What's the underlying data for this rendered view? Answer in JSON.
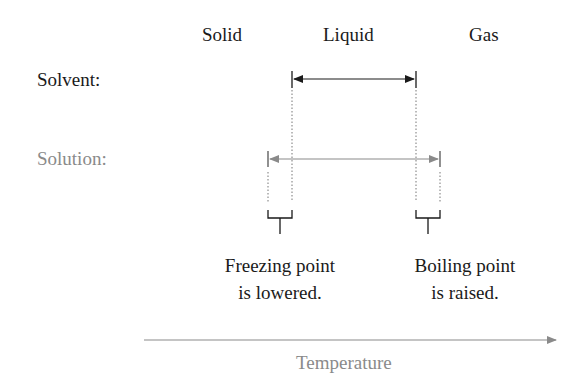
{
  "phases": {
    "solid": "Solid",
    "liquid": "Liquid",
    "gas": "Gas"
  },
  "rows": {
    "solvent_label": "Solvent:",
    "solution_label": "Solution:"
  },
  "annotations": {
    "freezing_line1": "Freezing point",
    "freezing_line2": "is lowered.",
    "boiling_line1": "Boiling point",
    "boiling_line2": "is raised."
  },
  "axis": {
    "label": "Temperature"
  },
  "colors": {
    "dark": "#1a1a1a",
    "grey": "#8a8a8a"
  }
}
